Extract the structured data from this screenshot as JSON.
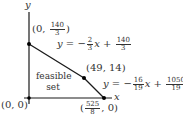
{
  "diagram": {
    "axes": {
      "x_label": "x",
      "y_label": "y",
      "origin_px": [
        29,
        98
      ],
      "x_axis_px": [
        24,
        112
      ],
      "y_axis_px": [
        12,
        104
      ]
    },
    "vertices": [
      {
        "id": "origin",
        "label_parts": [
          "(0, 0)"
        ],
        "coord": [
          0,
          0
        ],
        "px": [
          29,
          98
        ]
      },
      {
        "id": "y-intercept",
        "label_parts": [
          "(0, ",
          "140",
          "3",
          ")"
        ],
        "coord": [
          0,
          46.667
        ],
        "px": [
          29,
          44
        ]
      },
      {
        "id": "corner",
        "label_parts": [
          "(49, 14)"
        ],
        "coord": [
          49,
          14
        ],
        "px": [
          84,
          78
        ]
      },
      {
        "id": "x-intercept",
        "label_parts": [
          "(",
          "525",
          "8",
          ", 0)"
        ],
        "coord": [
          65.625,
          0
        ],
        "px": [
          104,
          98
        ]
      }
    ],
    "lines": [
      {
        "id": "line1",
        "eq": {
          "lhs": "y = −",
          "slope_num": "2",
          "slope_den": "3",
          "var": "x",
          "op": " + ",
          "int_num": "140",
          "int_den": "3"
        }
      },
      {
        "id": "line2",
        "eq": {
          "lhs": "y = −",
          "slope_num": "16",
          "slope_den": "19",
          "var": "x",
          "op": " + ",
          "int_num": "1050",
          "int_den": "19"
        }
      }
    ],
    "region_label": [
      "feasible",
      "set"
    ],
    "colors": {
      "line": "#1a1a1a",
      "point": "#000000",
      "text": "#333333",
      "background": "#ffffff"
    }
  }
}
